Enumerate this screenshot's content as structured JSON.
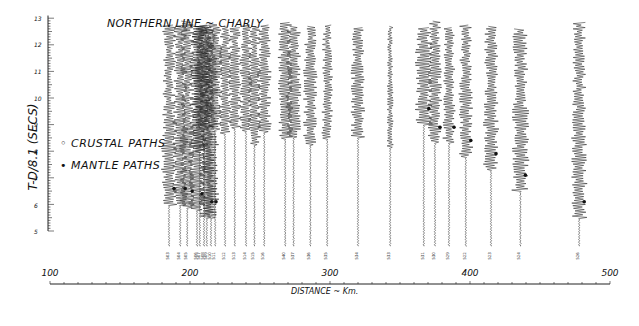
{
  "chart_data": {
    "type": "seismic-record-section",
    "title": "NORTHERN LINE ~ CHARLY",
    "xlabel": "DISTANCE ~ Km.",
    "ylabel": "T-D/8.1 (SECS)",
    "xlim": [
      100,
      500
    ],
    "ylim": [
      5,
      13
    ],
    "x_ticks": [
      100,
      200,
      300,
      400,
      500
    ],
    "y_ticks": [
      5,
      6,
      7,
      8,
      9,
      10,
      11,
      12,
      13
    ],
    "legend": [
      {
        "symbol": "open-circle",
        "label": "CRUSTAL PATHS"
      },
      {
        "symbol": "filled-circle",
        "label": "MANTLE PATHS"
      }
    ],
    "traces": [
      {
        "station": "503",
        "distance": 185,
        "mantle_time": 6.6,
        "amp": 1.0
      },
      {
        "station": "504",
        "distance": 193,
        "mantle_time": 6.6,
        "amp": 1.0
      },
      {
        "station": "505",
        "distance": 198,
        "mantle_time": 6.5,
        "amp": 1.0
      },
      {
        "station": "506",
        "distance": 205,
        "mantle_time": 6.4,
        "amp": 1.1
      },
      {
        "station": "507",
        "distance": 207,
        "mantle_time": null,
        "amp": 1.1
      },
      {
        "station": "508",
        "distance": 210,
        "mantle_time": null,
        "amp": 1.1
      },
      {
        "station": "509",
        "distance": 212,
        "mantle_time": 6.1,
        "amp": 1.0
      },
      {
        "station": "510",
        "distance": 215,
        "mantle_time": 6.1,
        "amp": 1.0
      },
      {
        "station": "511",
        "distance": 218,
        "mantle_time": null,
        "amp": 0.9
      },
      {
        "station": "512",
        "distance": 225,
        "mantle_time": null,
        "amp": 0.8
      },
      {
        "station": "513",
        "distance": 232,
        "mantle_time": null,
        "amp": 0.8
      },
      {
        "station": "514",
        "distance": 240,
        "mantle_time": null,
        "amp": 0.8
      },
      {
        "station": "515",
        "distance": 246,
        "mantle_time": null,
        "amp": 0.8
      },
      {
        "station": "516",
        "distance": 253,
        "mantle_time": null,
        "amp": 0.9
      },
      {
        "station": "540",
        "distance": 268,
        "mantle_time": null,
        "amp": 1.0
      },
      {
        "station": "537",
        "distance": 274,
        "mantle_time": null,
        "amp": 1.0
      },
      {
        "station": "536",
        "distance": 286,
        "mantle_time": null,
        "amp": 0.9
      },
      {
        "station": "535",
        "distance": 298,
        "mantle_time": null,
        "amp": 0.7
      },
      {
        "station": "534",
        "distance": 320,
        "mantle_time": null,
        "amp": 0.9
      },
      {
        "station": "533",
        "distance": 343,
        "mantle_time": null,
        "amp": 0.4
      },
      {
        "station": "531",
        "distance": 367,
        "mantle_time": 9.6,
        "amp": 1.1
      },
      {
        "station": "530",
        "distance": 375,
        "mantle_time": 8.9,
        "amp": 0.9
      },
      {
        "station": "529",
        "distance": 385,
        "mantle_time": 8.9,
        "amp": 0.8
      },
      {
        "station": "522",
        "distance": 397,
        "mantle_time": 8.4,
        "amp": 0.9
      },
      {
        "station": "523",
        "distance": 415,
        "mantle_time": 7.9,
        "amp": 1.0
      },
      {
        "station": "524",
        "distance": 436,
        "mantle_time": 7.1,
        "amp": 1.1
      },
      {
        "station": "526",
        "distance": 478,
        "mantle_time": 6.1,
        "amp": 1.0
      }
    ],
    "grid": false
  },
  "labels": {
    "title": "NORTHERN LINE ~ CHARLY",
    "ylabel": "T-D/8.1 (SECS)",
    "xlabel": "DISTANCE ~ Km.",
    "legend_crustal": "◦ CRUSTAL PATHS",
    "legend_mantle": "• MANTLE PATHS",
    "x100": "100",
    "x200": "200",
    "x300": "300",
    "x400": "400",
    "x500": "500",
    "y13": "13",
    "y12": "12",
    "y11": "11",
    "y10": "10",
    "y9": "9",
    "y8": "8",
    "y7": "7",
    "y6": "6",
    "y5": "5"
  }
}
